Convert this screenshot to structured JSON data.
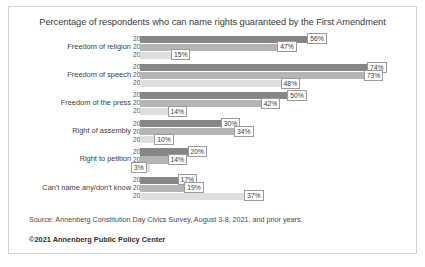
{
  "chart_data": {
    "type": "bar",
    "title": "Percentage of respondents who can name rights guaranteed by the First Amendment",
    "xlabel": "",
    "ylabel": "",
    "xlim": [
      0,
      80
    ],
    "grid": false,
    "orientation": "horizontal",
    "legend": "none",
    "series_labels": [
      "2021",
      "2020",
      "2017"
    ],
    "categories": [
      "Freedom of religion",
      "Freedom of speech",
      "Freedom of the press",
      "Right of assembly",
      "Right to petition",
      "Can't name any/don't know"
    ],
    "series": [
      {
        "name": "2021",
        "values": [
          56,
          74,
          50,
          30,
          20,
          17
        ],
        "color": "#868686"
      },
      {
        "name": "2020",
        "values": [
          47,
          73,
          42,
          34,
          14,
          19
        ],
        "color": "#b5b5b5"
      },
      {
        "name": "2017",
        "values": [
          15,
          48,
          14,
          10,
          3,
          37
        ],
        "color": "#dedede"
      }
    ],
    "data_labels": [
      [
        "56%",
        "47%",
        "15%"
      ],
      [
        "74%",
        "73%",
        "48%"
      ],
      [
        "50%",
        "42%",
        "14%"
      ],
      [
        "30%",
        "34%",
        "10%"
      ],
      [
        "20%",
        "14%",
        "3%"
      ],
      [
        "17%",
        "19%",
        "37%"
      ]
    ]
  },
  "footer": {
    "source": "Source: Annenberg Constitution Day Civics Survey, August 3-8, 2021, and prior years.",
    "copyright": "©2021 Annenberg Public Policy Center"
  },
  "colors": {
    "bar_2021": "#868686",
    "bar_2020": "#b5b5b5",
    "bar_2017": "#dedede",
    "frame": "#d2d2d2",
    "text": "#3a3a3a"
  }
}
